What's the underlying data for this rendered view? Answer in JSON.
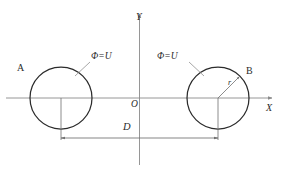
{
  "figure": {
    "axes": {
      "x_label": "X",
      "y_label": "Y",
      "origin_label": "O"
    },
    "conductors": [
      {
        "node_label": "A",
        "potential_label": "Φ=U",
        "center_x": 61,
        "center_y": 98,
        "radius": 31
      },
      {
        "node_label": "B",
        "potential_label": "Φ=U",
        "center_x": 218,
        "center_y": 98,
        "radius": 31
      }
    ],
    "dimensions": {
      "separation_label": "D",
      "radius_label": "r"
    },
    "colors": {
      "circle_stroke": "#2b2b2b",
      "axis_stroke": "#8a8a8a",
      "dimension_stroke": "#707070",
      "leader_stroke": "#8a8a8a",
      "text": "#2b2b2b",
      "background": "#ffffff"
    }
  }
}
